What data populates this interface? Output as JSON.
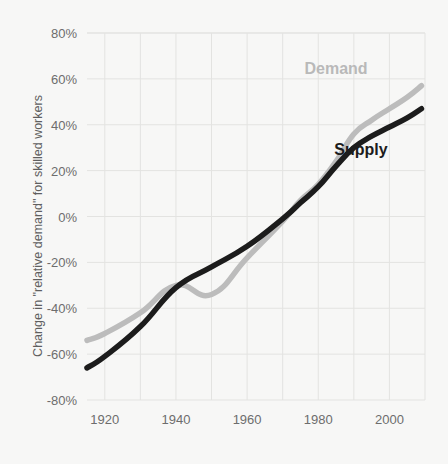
{
  "chart_data": {
    "type": "line",
    "title": "",
    "xlabel": "",
    "ylabel": "Change in \"relative demand\" for skilled workers",
    "xlim": [
      1915,
      2010
    ],
    "ylim": [
      -80,
      80
    ],
    "grid": true,
    "legend_position": "inline-annotations",
    "x_ticks": [
      "1920",
      "1940",
      "1960",
      "1980",
      "2000"
    ],
    "x_tick_values": [
      1920,
      1940,
      1960,
      1980,
      2000
    ],
    "y_ticks": [
      "80%",
      "60%",
      "40%",
      "20%",
      "0%",
      "-20%",
      "-40%",
      "-60%",
      "-80%"
    ],
    "y_tick_values": [
      80,
      60,
      40,
      20,
      0,
      -20,
      -40,
      -60,
      -80
    ],
    "gridline_x_values": [
      1920,
      1930,
      1940,
      1950,
      1960,
      1970,
      1980,
      1990,
      2000,
      2010
    ],
    "series": [
      {
        "name": "Demand",
        "color": "#bcbcbc",
        "label_x": 1985,
        "label_y": 62,
        "x": [
          1915,
          1920,
          1930,
          1940,
          1950,
          1960,
          1970,
          1975,
          1980,
          1985,
          1990,
          1995,
          2000,
          2005,
          2009
        ],
        "values": [
          -54,
          -51,
          -42,
          -30,
          -34,
          -18,
          -2,
          7,
          14,
          24,
          36,
          42,
          47,
          52,
          57
        ]
      },
      {
        "name": "Supply",
        "color": "#1c1c1c",
        "label_x": 1992,
        "label_y": 27,
        "x": [
          1915,
          1920,
          1930,
          1940,
          1950,
          1960,
          1970,
          1975,
          1980,
          1985,
          1990,
          1995,
          2000,
          2005,
          2009
        ],
        "values": [
          -66,
          -61,
          -48,
          -31,
          -22,
          -13,
          -1,
          6,
          13,
          22,
          30,
          35,
          39,
          43,
          47
        ]
      }
    ]
  },
  "colors": {
    "background": "#f7f7f6",
    "gridline": "#e3e3e1",
    "axis_text": "#6d6d6d",
    "demand": "#bcbcbc",
    "supply": "#1c1c1c"
  }
}
